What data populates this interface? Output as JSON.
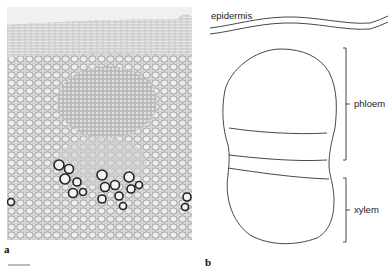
{
  "panels": [
    {
      "id": "a",
      "label": "a",
      "type": "micrograph",
      "description": "Light micrograph of stem cross-section showing epidermis, phloem bundle and xylem vessels"
    },
    {
      "id": "b",
      "label": "b",
      "type": "line-drawing"
    }
  ],
  "diagram": {
    "labels": {
      "epidermis": "epidermis",
      "phloem": "phloem",
      "xylem": "xylem"
    },
    "line_color": "#333333"
  }
}
